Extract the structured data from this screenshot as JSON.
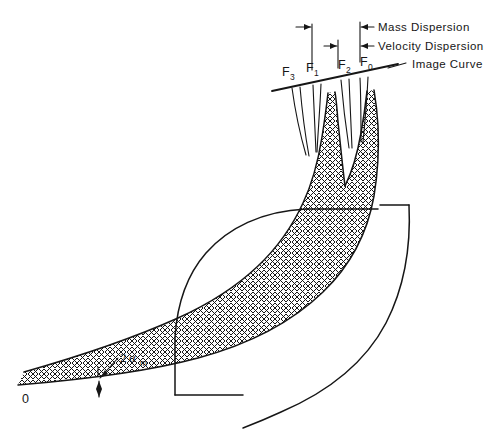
{
  "figure": {
    "origin_label": "0",
    "angle_label_prefix": "2",
    "angle_label_symbol": "α",
    "angle_label_subscript": "m",
    "image_curve_label": "Image Curve",
    "mass_dispersion_label": "Mass Dispersion",
    "velocity_dispersion_label": "Velocity Dispersion"
  },
  "focal_points": [
    {
      "id": "F3",
      "base": "F",
      "sub": "3",
      "x": 288,
      "y": 76
    },
    {
      "id": "F1",
      "base": "F",
      "sub": "1",
      "x": 312,
      "y": 73
    },
    {
      "id": "F2",
      "base": "F",
      "sub": "2",
      "x": 345,
      "y": 69
    },
    {
      "id": "F0",
      "base": "F",
      "sub": "0",
      "x": 368,
      "y": 66
    }
  ],
  "dimensions": [
    {
      "id": "mass-dispersion",
      "label": "Mass Dispersion",
      "arrow_left_x": 300,
      "arrow_right_x": 360,
      "y": 28
    },
    {
      "id": "velocity-dispersion",
      "label": "Velocity Dispersion",
      "arrow_left_x": 337,
      "arrow_right_x": 360,
      "y": 46
    }
  ],
  "colors": {
    "ink": "#161616",
    "paper": "#ffffff"
  },
  "geometry": {
    "image_curve": {
      "x1": 272,
      "y1": 89,
      "x2": 400,
      "y2": 62
    },
    "leader_line": {
      "x1": 386,
      "y1": 68,
      "x2": 404,
      "y2": 63
    },
    "beam_vertex": {
      "x": 18,
      "y": 385
    }
  }
}
